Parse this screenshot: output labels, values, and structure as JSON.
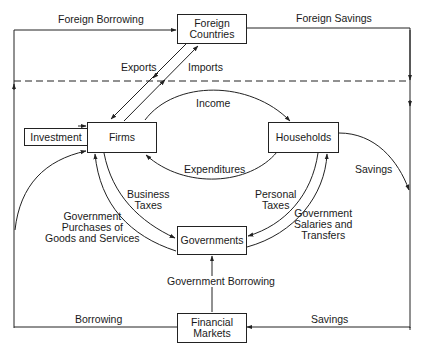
{
  "diagram": {
    "type": "circular-flow",
    "nodes": {
      "foreign_countries": {
        "line1": "Foreign",
        "line2": "Countries"
      },
      "firms": {
        "label": "Firms"
      },
      "households": {
        "label": "Households"
      },
      "investment": {
        "label": "Investment"
      },
      "governments": {
        "label": "Governments"
      },
      "financial_markets": {
        "line1": "Financial",
        "line2": "Markets"
      }
    },
    "flows": {
      "foreign_borrowing": "Foreign Borrowing",
      "foreign_savings": "Foreign Savings",
      "exports": "Exports",
      "imports": "Imports",
      "income": "Income",
      "expenditures": "Expenditures",
      "savings_households": "Savings",
      "business_taxes": {
        "line1": "Business",
        "line2": "Taxes"
      },
      "personal_taxes": {
        "line1": "Personal",
        "line2": "Taxes"
      },
      "gov_purchases": {
        "line1": "Government",
        "line2": "Purchases of",
        "line3": "Goods and Services"
      },
      "gov_salaries": {
        "line1": "Government",
        "line2": "Salaries and",
        "line3": "Transfers"
      },
      "government_borrowing": "Government Borrowing",
      "borrowing": "Borrowing",
      "savings_bottom": "Savings"
    },
    "colors": {
      "line": "#222222",
      "background": "#ffffff"
    }
  }
}
